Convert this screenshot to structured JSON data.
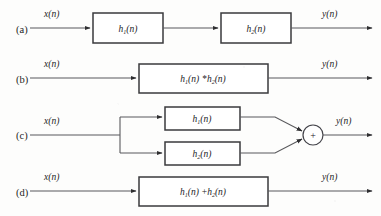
{
  "figure": {
    "colors": {
      "background": "#fdfdfc",
      "wire": "#59595c",
      "box_border": "#3a3a3c",
      "box_fill": "#ffffff",
      "text": "#1d1d1f"
    },
    "signals": {
      "input": "x(n)",
      "input_base": "x",
      "output": "y(n)",
      "output_base": "y",
      "arg": "(n)"
    },
    "impulse_response": {
      "base": "h",
      "sub1": "1",
      "sub2": "2",
      "arg": "(n)",
      "convolution_symbol": "*",
      "sum_symbol": "+",
      "adder_symbol": "+"
    },
    "rows": [
      {
        "id": "row-a",
        "label": "(a)",
        "kind": "cascade",
        "input_label": "x(n)",
        "output_label": "y(n)",
        "blocks": [
          {
            "name": "h1-block",
            "base": "h",
            "sub": "1",
            "arg": "(n)",
            "text": "h1(n)"
          },
          {
            "name": "h2-block",
            "base": "h",
            "sub": "2",
            "arg": "(n)",
            "text": "h2(n)"
          }
        ]
      },
      {
        "id": "row-b",
        "label": "(b)",
        "kind": "single-convolution",
        "input_label": "x(n)",
        "output_label": "y(n)",
        "blocks": [
          {
            "name": "h1-conv-h2-block",
            "text": "h1(n) *h2(n)"
          }
        ]
      },
      {
        "id": "row-c",
        "label": "(c)",
        "kind": "parallel-with-adder",
        "input_label": "x(n)",
        "output_label": "y(n)",
        "adder": "+",
        "blocks": [
          {
            "name": "h1-block",
            "base": "h",
            "sub": "1",
            "arg": "(n)",
            "text": "h1(n)"
          },
          {
            "name": "h2-block",
            "base": "h",
            "sub": "2",
            "arg": "(n)",
            "text": "h2(n)"
          }
        ]
      },
      {
        "id": "row-d",
        "label": "(d)",
        "kind": "single-sum",
        "input_label": "x(n)",
        "output_label": "y(n)",
        "blocks": [
          {
            "name": "h1-plus-h2-block",
            "text": "h1(n) +h2(n)"
          }
        ]
      }
    ]
  }
}
